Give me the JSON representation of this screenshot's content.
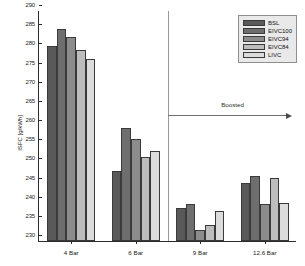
{
  "chart_data": {
    "type": "bar",
    "title": "",
    "xlabel": "",
    "ylabel": "ISFC [g/kWh]",
    "ylim": [
      230,
      290
    ],
    "yticks": [
      230,
      235,
      240,
      245,
      250,
      255,
      260,
      265,
      270,
      275,
      280,
      285,
      290
    ],
    "grid": false,
    "legend_position": "top-right",
    "categories": [
      "4 Bar",
      "6 Bar",
      "9 Bar",
      "12.6 Bar"
    ],
    "series": [
      {
        "name": "BSL",
        "color": "#595959",
        "values": [
          280.8,
          248.2,
          238.6,
          245.1
        ]
      },
      {
        "name": "EIVC100",
        "color": "#6e6e6e",
        "values": [
          285.2,
          259.5,
          239.6,
          246.9
        ]
      },
      {
        "name": "EIVC94",
        "color": "#8c8c8c",
        "values": [
          283.3,
          256.7,
          232.8,
          239.6
        ]
      },
      {
        "name": "EIVC84",
        "color": "#bdbdbd",
        "values": [
          279.8,
          251.9,
          234.2,
          246.5
        ]
      },
      {
        "name": "LIVC",
        "color": "#dcdcdc",
        "values": [
          277.6,
          253.6,
          237.8,
          240.0
        ]
      }
    ],
    "annotations": [
      {
        "name": "boosted",
        "label": "Boosted",
        "arrow": "right"
      }
    ]
  }
}
